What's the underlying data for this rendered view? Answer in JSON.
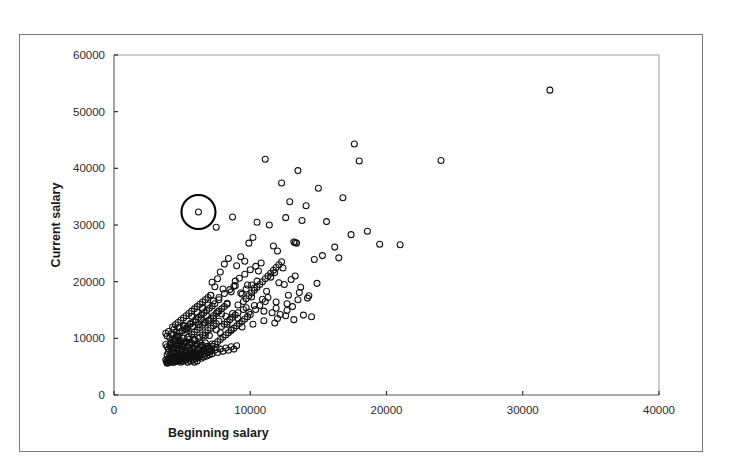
{
  "figure": {
    "background_color": "#ffffff",
    "border_color": "#7a7a7a",
    "point_color": "#111111",
    "highlight_color": "#000000"
  },
  "axes": {
    "x_title": "Beginning salary",
    "y_title": "Current salary",
    "x_ticks": [
      "0",
      "10000",
      "20000",
      "30000",
      "40000"
    ],
    "y_ticks": [
      "0",
      "10000",
      "20000",
      "30000",
      "40000",
      "50000",
      "60000"
    ]
  },
  "chart_data": {
    "type": "scatter",
    "title": "",
    "xlabel": "Beginning salary",
    "ylabel": "Current salary",
    "xlim": [
      0,
      40000
    ],
    "ylim": [
      0,
      60000
    ],
    "xticks": [
      0,
      10000,
      20000,
      30000,
      40000
    ],
    "yticks": [
      0,
      10000,
      20000,
      30000,
      40000,
      50000,
      60000
    ],
    "grid": false,
    "legend": false,
    "marker": "open-circle",
    "marker_size": 4,
    "annotations": [
      {
        "type": "highlight-circle",
        "label": "outlier-highlight",
        "x": 6200,
        "y": 32300,
        "radius_px": 17
      }
    ],
    "points": [
      [
        31992,
        53800
      ],
      [
        24000,
        41400
      ],
      [
        21000,
        26500
      ],
      [
        17640,
        44300
      ],
      [
        18000,
        41300
      ],
      [
        16800,
        34800
      ],
      [
        15000,
        36500
      ],
      [
        13500,
        39600
      ],
      [
        11100,
        41600
      ],
      [
        12300,
        37400
      ],
      [
        14100,
        33400
      ],
      [
        12900,
        34100
      ],
      [
        15600,
        30600
      ],
      [
        18600,
        28900
      ],
      [
        19500,
        26600
      ],
      [
        17400,
        28300
      ],
      [
        16200,
        26100
      ],
      [
        13800,
        30800
      ],
      [
        12600,
        31300
      ],
      [
        11400,
        30000
      ],
      [
        10500,
        30500
      ],
      [
        10200,
        27800
      ],
      [
        11700,
        26300
      ],
      [
        12000,
        25400
      ],
      [
        13200,
        27000
      ],
      [
        13400,
        26800
      ],
      [
        13300,
        26900
      ],
      [
        14700,
        23900
      ],
      [
        15300,
        24600
      ],
      [
        16500,
        24200
      ],
      [
        8700,
        31400
      ],
      [
        6200,
        32300
      ],
      [
        7500,
        29600
      ],
      [
        9300,
        24400
      ],
      [
        9900,
        26800
      ],
      [
        10800,
        23300
      ],
      [
        11800,
        21600
      ],
      [
        12400,
        22400
      ],
      [
        13000,
        20400
      ],
      [
        12100,
        19800
      ],
      [
        11500,
        20800
      ],
      [
        10600,
        21900
      ],
      [
        9600,
        23600
      ],
      [
        9000,
        22800
      ],
      [
        8400,
        24100
      ],
      [
        8100,
        23100
      ],
      [
        7800,
        21700
      ],
      [
        8900,
        20100
      ],
      [
        9800,
        19400
      ],
      [
        10300,
        18900
      ],
      [
        11200,
        18300
      ],
      [
        12800,
        17600
      ],
      [
        13600,
        18100
      ],
      [
        14200,
        17100
      ],
      [
        11900,
        16400
      ],
      [
        10900,
        16900
      ],
      [
        10100,
        17300
      ],
      [
        9400,
        17800
      ],
      [
        8600,
        18200
      ],
      [
        8000,
        18700
      ],
      [
        7400,
        19100
      ],
      [
        7100,
        17600
      ],
      [
        7700,
        16800
      ],
      [
        8300,
        16200
      ],
      [
        9100,
        15900
      ],
      [
        9700,
        15400
      ],
      [
        10400,
        15100
      ],
      [
        11000,
        14800
      ],
      [
        11600,
        14500
      ],
      [
        12200,
        14200
      ],
      [
        12700,
        14900
      ],
      [
        13100,
        15600
      ],
      [
        13900,
        14100
      ],
      [
        14500,
        13800
      ],
      [
        8200,
        13900
      ],
      [
        7900,
        14300
      ],
      [
        7600,
        14700
      ],
      [
        7300,
        13600
      ],
      [
        7000,
        13200
      ],
      [
        6800,
        14000
      ],
      [
        6600,
        12800
      ],
      [
        6400,
        13400
      ],
      [
        6200,
        12400
      ],
      [
        6000,
        12900
      ],
      [
        5800,
        12100
      ],
      [
        5600,
        12600
      ],
      [
        5400,
        11800
      ],
      [
        5200,
        12200
      ],
      [
        5000,
        11400
      ],
      [
        4800,
        11900
      ],
      [
        4600,
        11100
      ],
      [
        4400,
        11600
      ],
      [
        4200,
        10800
      ],
      [
        4000,
        11200
      ],
      [
        3900,
        10400
      ],
      [
        3800,
        10900
      ],
      [
        4100,
        10100
      ],
      [
        4300,
        10600
      ],
      [
        4500,
        9900
      ],
      [
        4700,
        10300
      ],
      [
        4900,
        9600
      ],
      [
        5100,
        10000
      ],
      [
        5300,
        9400
      ],
      [
        5500,
        9800
      ],
      [
        5700,
        9200
      ],
      [
        5900,
        9600
      ],
      [
        6100,
        9000
      ],
      [
        6300,
        9400
      ],
      [
        6500,
        8800
      ],
      [
        6700,
        9200
      ],
      [
        6900,
        8600
      ],
      [
        7200,
        9000
      ],
      [
        7500,
        8400
      ],
      [
        3800,
        8900
      ],
      [
        3900,
        8500
      ],
      [
        4000,
        8100
      ],
      [
        4100,
        8700
      ],
      [
        4200,
        8300
      ],
      [
        4300,
        7900
      ],
      [
        4400,
        8500
      ],
      [
        4500,
        8100
      ],
      [
        4600,
        7700
      ],
      [
        4700,
        8300
      ],
      [
        4800,
        7900
      ],
      [
        4900,
        7500
      ],
      [
        5000,
        8100
      ],
      [
        5100,
        7700
      ],
      [
        5200,
        7300
      ],
      [
        5300,
        7900
      ],
      [
        5400,
        7500
      ],
      [
        5500,
        7100
      ],
      [
        5600,
        7700
      ],
      [
        5700,
        7300
      ],
      [
        5800,
        6900
      ],
      [
        5900,
        7500
      ],
      [
        6000,
        7100
      ],
      [
        6100,
        6700
      ],
      [
        6200,
        7300
      ],
      [
        6300,
        6900
      ],
      [
        6400,
        6500
      ],
      [
        6500,
        7100
      ],
      [
        6600,
        6700
      ],
      [
        6700,
        7300
      ],
      [
        6800,
        6900
      ],
      [
        6900,
        7500
      ],
      [
        7000,
        7100
      ],
      [
        7100,
        7700
      ],
      [
        7200,
        7300
      ],
      [
        7400,
        7900
      ],
      [
        7600,
        7500
      ],
      [
        7800,
        8100
      ],
      [
        8000,
        7700
      ],
      [
        8200,
        8300
      ],
      [
        8400,
        7900
      ],
      [
        8600,
        8500
      ],
      [
        8800,
        8100
      ],
      [
        9000,
        8700
      ],
      [
        4000,
        6400
      ],
      [
        4100,
        6000
      ],
      [
        4200,
        6600
      ],
      [
        4300,
        6200
      ],
      [
        4400,
        5800
      ],
      [
        4500,
        6400
      ],
      [
        4600,
        6000
      ],
      [
        4700,
        6600
      ],
      [
        4800,
        6200
      ],
      [
        4900,
        5800
      ],
      [
        5000,
        6400
      ],
      [
        5100,
        6000
      ],
      [
        5200,
        6600
      ],
      [
        5300,
        6200
      ],
      [
        5400,
        5800
      ],
      [
        5500,
        6400
      ],
      [
        5600,
        6000
      ],
      [
        5700,
        6600
      ],
      [
        5800,
        6200
      ],
      [
        5900,
        5800
      ],
      [
        6000,
        6400
      ],
      [
        6100,
        6000
      ],
      [
        6200,
        6600
      ],
      [
        3900,
        7100
      ],
      [
        4000,
        7500
      ],
      [
        4100,
        7000
      ],
      [
        4200,
        7400
      ],
      [
        4300,
        6900
      ],
      [
        4400,
        7300
      ],
      [
        4500,
        6800
      ],
      [
        4600,
        7200
      ],
      [
        4700,
        6700
      ],
      [
        4800,
        7100
      ],
      [
        4900,
        6600
      ],
      [
        5000,
        7000
      ],
      [
        5100,
        6500
      ],
      [
        5200,
        6900
      ],
      [
        5300,
        6400
      ],
      [
        5400,
        6800
      ],
      [
        5500,
        7200
      ],
      [
        5600,
        6700
      ],
      [
        5700,
        7100
      ],
      [
        5800,
        7500
      ],
      [
        5900,
        7000
      ],
      [
        6000,
        7400
      ],
      [
        6100,
        6900
      ],
      [
        6300,
        7300
      ],
      [
        6500,
        7700
      ],
      [
        6700,
        8100
      ],
      [
        4200,
        9300
      ],
      [
        4400,
        9700
      ],
      [
        4600,
        9100
      ],
      [
        4800,
        9500
      ],
      [
        5000,
        8900
      ],
      [
        5200,
        9300
      ],
      [
        5400,
        8700
      ],
      [
        5600,
        9100
      ],
      [
        5800,
        8500
      ],
      [
        6000,
        8900
      ],
      [
        6200,
        8300
      ],
      [
        6400,
        8700
      ],
      [
        6600,
        8100
      ],
      [
        6800,
        8500
      ],
      [
        7000,
        8200
      ],
      [
        7200,
        8600
      ],
      [
        7400,
        9000
      ],
      [
        7600,
        9400
      ],
      [
        7800,
        9800
      ],
      [
        8000,
        10200
      ],
      [
        8200,
        10600
      ],
      [
        8400,
        11000
      ],
      [
        8600,
        11400
      ],
      [
        8800,
        11800
      ],
      [
        9000,
        12200
      ],
      [
        9200,
        12600
      ],
      [
        9400,
        13000
      ],
      [
        9600,
        13400
      ],
      [
        9800,
        13800
      ],
      [
        10000,
        14200
      ],
      [
        6300,
        10200
      ],
      [
        6500,
        10600
      ],
      [
        6700,
        11000
      ],
      [
        6900,
        11400
      ],
      [
        7100,
        11800
      ],
      [
        7300,
        12200
      ],
      [
        7500,
        12600
      ],
      [
        7700,
        13000
      ],
      [
        7900,
        12100
      ],
      [
        8100,
        12500
      ],
      [
        8300,
        12900
      ],
      [
        8500,
        13300
      ],
      [
        8700,
        13700
      ],
      [
        8900,
        14100
      ],
      [
        9100,
        14500
      ],
      [
        5500,
        10300
      ],
      [
        5700,
        10700
      ],
      [
        5900,
        11100
      ],
      [
        6100,
        11500
      ],
      [
        6300,
        11900
      ],
      [
        6500,
        12300
      ],
      [
        6700,
        12700
      ],
      [
        6900,
        13100
      ],
      [
        7100,
        13500
      ],
      [
        7300,
        14000
      ],
      [
        7500,
        14400
      ],
      [
        7700,
        14800
      ],
      [
        7900,
        15200
      ],
      [
        8100,
        15600
      ],
      [
        8300,
        16000
      ],
      [
        4600,
        10500
      ],
      [
        4800,
        10900
      ],
      [
        5000,
        11300
      ],
      [
        5200,
        11700
      ],
      [
        5400,
        12100
      ],
      [
        5600,
        12500
      ],
      [
        5800,
        12900
      ],
      [
        6000,
        13300
      ],
      [
        6200,
        13700
      ],
      [
        6400,
        14100
      ],
      [
        6600,
        14500
      ],
      [
        6800,
        14900
      ],
      [
        7000,
        15300
      ],
      [
        7200,
        15700
      ],
      [
        7400,
        16100
      ],
      [
        4300,
        12000
      ],
      [
        4500,
        12400
      ],
      [
        4700,
        12800
      ],
      [
        4900,
        13200
      ],
      [
        5100,
        13600
      ],
      [
        5300,
        14000
      ],
      [
        5500,
        14400
      ],
      [
        5700,
        14800
      ],
      [
        5900,
        15200
      ],
      [
        6100,
        15600
      ],
      [
        6300,
        16000
      ],
      [
        6500,
        16400
      ],
      [
        6700,
        16800
      ],
      [
        6900,
        17200
      ],
      [
        7100,
        17600
      ],
      [
        9500,
        16500
      ],
      [
        9700,
        17000
      ],
      [
        9900,
        17500
      ],
      [
        10100,
        18000
      ],
      [
        10300,
        18500
      ],
      [
        10500,
        19000
      ],
      [
        10700,
        19500
      ],
      [
        10900,
        20000
      ],
      [
        11100,
        20500
      ],
      [
        11300,
        21000
      ],
      [
        11500,
        21500
      ],
      [
        11700,
        22000
      ],
      [
        11900,
        22500
      ],
      [
        12100,
        23000
      ],
      [
        12300,
        23500
      ],
      [
        3800,
        6200
      ],
      [
        3850,
        5900
      ],
      [
        3900,
        5600
      ],
      [
        3950,
        6100
      ],
      [
        4000,
        5700
      ],
      [
        4050,
        6300
      ],
      [
        4100,
        5900
      ],
      [
        4150,
        6500
      ],
      [
        4200,
        6100
      ],
      [
        4250,
        5800
      ],
      [
        4300,
        6400
      ],
      [
        4350,
        6000
      ],
      [
        4400,
        6600
      ],
      [
        4450,
        6200
      ],
      [
        4500,
        5900
      ],
      [
        4550,
        6500
      ],
      [
        4600,
        6100
      ],
      [
        4650,
        6700
      ],
      [
        4700,
        6300
      ],
      [
        4750,
        6000
      ],
      [
        4800,
        6600
      ],
      [
        4850,
        6200
      ],
      [
        4900,
        6800
      ],
      [
        4950,
        6400
      ],
      [
        5000,
        6100
      ],
      [
        7200,
        19900
      ],
      [
        7600,
        20500
      ],
      [
        8800,
        19200
      ],
      [
        9200,
        20600
      ],
      [
        9600,
        21300
      ],
      [
        10000,
        22100
      ],
      [
        10400,
        22700
      ],
      [
        5100,
        12200
      ],
      [
        5300,
        11500
      ],
      [
        5700,
        13900
      ],
      [
        6100,
        14600
      ],
      [
        6500,
        15300
      ],
      [
        6900,
        15900
      ],
      [
        7300,
        16600
      ],
      [
        7700,
        17200
      ],
      [
        8100,
        17900
      ],
      [
        8500,
        18600
      ],
      [
        8900,
        19300
      ],
      [
        9300,
        18000
      ],
      [
        9700,
        18700
      ],
      [
        10100,
        19400
      ],
      [
        10500,
        20100
      ],
      [
        4150,
        9000
      ],
      [
        4350,
        9400
      ],
      [
        4550,
        8800
      ],
      [
        4750,
        9200
      ],
      [
        4950,
        8600
      ],
      [
        5150,
        9000
      ],
      [
        5350,
        8400
      ],
      [
        5550,
        8800
      ],
      [
        5750,
        8200
      ],
      [
        5950,
        8600
      ],
      [
        6150,
        8000
      ],
      [
        6350,
        8400
      ],
      [
        6550,
        7800
      ],
      [
        6750,
        8200
      ],
      [
        6950,
        7600
      ],
      [
        7150,
        8000
      ],
      [
        12500,
        19500
      ],
      [
        13300,
        21000
      ],
      [
        11300,
        17200
      ],
      [
        10700,
        15800
      ],
      [
        9900,
        14600
      ],
      [
        9100,
        13500
      ],
      [
        8300,
        12500
      ],
      [
        7500,
        11500
      ],
      [
        6700,
        10500
      ],
      [
        5900,
        9800
      ],
      [
        5100,
        9100
      ],
      [
        4300,
        8400
      ],
      [
        12000,
        13500
      ],
      [
        12600,
        14000
      ],
      [
        13200,
        13300
      ],
      [
        11800,
        12700
      ],
      [
        11000,
        13100
      ],
      [
        10200,
        12500
      ],
      [
        9400,
        12000
      ],
      [
        8600,
        11500
      ],
      [
        7800,
        11000
      ],
      [
        7000,
        10500
      ],
      [
        6200,
        10000
      ],
      [
        5400,
        10200
      ],
      [
        4600,
        9600
      ],
      [
        8700,
        14400
      ],
      [
        9500,
        15100
      ],
      [
        10300,
        15800
      ],
      [
        11100,
        16500
      ],
      [
        11900,
        15300
      ],
      [
        12700,
        16100
      ],
      [
        13500,
        16800
      ],
      [
        14300,
        17500
      ],
      [
        13700,
        19000
      ],
      [
        14900,
        19700
      ]
    ]
  }
}
